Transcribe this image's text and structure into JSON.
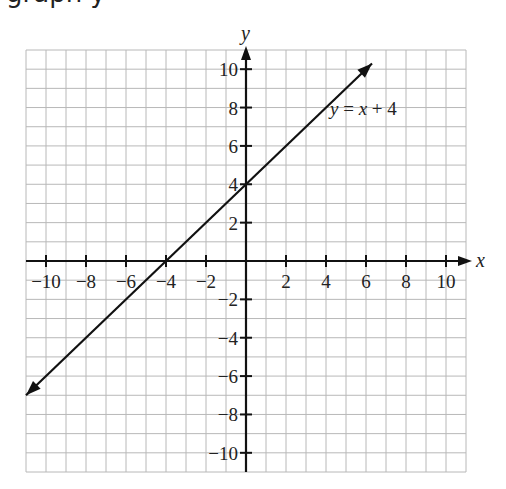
{
  "page": {
    "top_text_fragment": "graph y"
  },
  "chart_data": {
    "type": "line",
    "title": "",
    "xlabel": "x",
    "ylabel": "y",
    "xlim": [
      -11,
      11
    ],
    "ylim": [
      -11,
      11
    ],
    "grid": true,
    "grid_step": 1,
    "x_ticks": [
      -10,
      -8,
      -6,
      -4,
      -2,
      2,
      4,
      6,
      8,
      10
    ],
    "y_ticks": [
      10,
      8,
      6,
      4,
      2,
      -2,
      -4,
      -6,
      -8,
      -10
    ],
    "x_tick_labels": [
      "−10",
      "−8",
      "−6",
      "−4",
      "−2",
      "2",
      "4",
      "6",
      "8",
      "10"
    ],
    "y_tick_labels": [
      "10",
      "8",
      "6",
      "4",
      "2",
      "−2",
      "−4",
      "−6",
      "−8",
      "−10"
    ],
    "series": [
      {
        "name": "y = x + 4",
        "equation": "y = x + 4",
        "slope": 1,
        "intercept": 4,
        "x": [
          -11,
          6.3
        ],
        "y": [
          -7,
          10.3
        ],
        "arrows_both_ends": true
      }
    ],
    "annotations": [
      {
        "text": "y = x + 4",
        "x": 4.2,
        "y": 7.6
      }
    ],
    "key_points": [
      {
        "label": "x-intercept",
        "x": -4,
        "y": 0
      },
      {
        "label": "y-intercept",
        "x": 0,
        "y": 4
      }
    ]
  }
}
